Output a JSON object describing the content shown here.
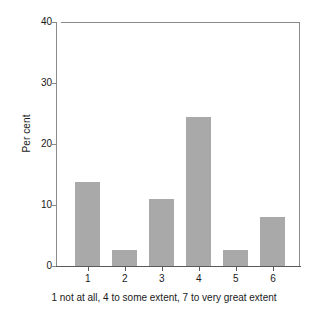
{
  "chart_data": {
    "type": "bar",
    "title": "",
    "subtitle": "",
    "xlabel": "1 not at all, 4 to some extent, 7 to very great extent",
    "ylabel": "Per cent",
    "categories": [
      "1",
      "2",
      "3",
      "4",
      "5",
      "6"
    ],
    "values": [
      13.8,
      2.6,
      11.0,
      24.4,
      2.6,
      8.0
    ],
    "ylim": [
      0,
      40
    ],
    "yticks": [
      0,
      10,
      20,
      30,
      40
    ],
    "ytick_labels": [
      "0",
      "10",
      "20",
      "30",
      "40"
    ],
    "xtick_labels": [
      "1",
      "2",
      "3",
      "4",
      "5",
      "6"
    ],
    "grid": false,
    "legend": null,
    "legend_position": "none",
    "bar_color": "#a9a9a9",
    "axis_color": "#8a8a8a",
    "background": "#ffffff",
    "annotations": []
  },
  "figure": {
    "caption": "1 not at all, 4 to some extent, 7 to very great extent",
    "axis_title_y": "Per cent"
  }
}
